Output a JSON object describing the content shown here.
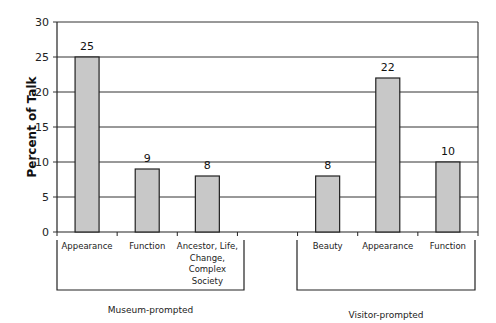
{
  "chart_data": {
    "type": "bar",
    "title": "",
    "xlabel": "",
    "ylabel": "Percent of Talk",
    "ylim": [
      0,
      30
    ],
    "yticks": [
      0,
      5,
      10,
      15,
      20,
      25,
      30
    ],
    "grid": true,
    "legend": null,
    "categories": [
      "Appearance",
      "Function",
      "Ancestor, Life, Change, Complex Society",
      "",
      "Beauty",
      "Appearance",
      "Function"
    ],
    "values": [
      25,
      9,
      8,
      null,
      8,
      22,
      10
    ],
    "groups": [
      {
        "name": "Museum-prompted",
        "categories": [
          "Appearance",
          "Function",
          "Ancestor, Life, Change, Complex Society"
        ],
        "values": [
          25,
          9,
          8
        ]
      },
      {
        "name": "Visitor-prompted",
        "categories": [
          "Beauty",
          "Appearance",
          "Function"
        ],
        "values": [
          8,
          22,
          10
        ]
      }
    ],
    "data_labels": [
      "25",
      "9",
      "8",
      "",
      "8",
      "22",
      "10"
    ],
    "category_label_lines": [
      [
        "Appearance"
      ],
      [
        "Function"
      ],
      [
        "Ancestor, Life,",
        "Change,",
        "Complex",
        "Society"
      ],
      [],
      [
        "Beauty"
      ],
      [
        "Appearance"
      ],
      [
        "Function"
      ]
    ]
  },
  "colors": {
    "bar_fill": "#c8c8c8",
    "bar_stroke": "#222222",
    "grid": "#333333"
  }
}
